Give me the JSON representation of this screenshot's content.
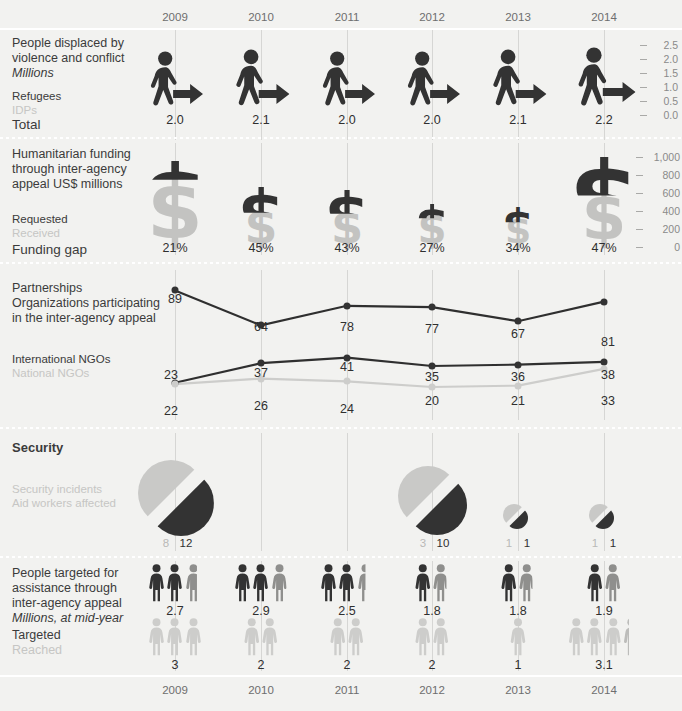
{
  "years": [
    "2009",
    "2010",
    "2011",
    "2012",
    "2013",
    "2014"
  ],
  "colors": {
    "background": "#f2f2f0",
    "dark": "#333333",
    "light": "#c9c9c7",
    "text": "#3b3b3b",
    "muted": "#c6c6c4",
    "gridline": "#d6d6d4"
  },
  "sections": {
    "displaced": {
      "title": "People displaced by\nviolence and conflict",
      "subtitle": "Millions",
      "legend_dark": "Refugees",
      "legend_light": "IDPs",
      "total_label": "Total",
      "axis_ticks": [
        "2.5",
        "2.0",
        "1.5",
        "1.0",
        "0.5",
        "0.0"
      ]
    },
    "funding": {
      "title": "Humanitarian funding\nthrough inter-agency\nappeal ",
      "title_italic": "US$ millions",
      "legend_dark": "Requested",
      "legend_light": "Received",
      "gap_label": "Funding gap",
      "axis_ticks": [
        "1,000",
        "800",
        "600",
        "400",
        "200",
        "0"
      ]
    },
    "partnerships": {
      "title": "Partnerships",
      "subtitle": "Organizations participating\nin the inter-agency appeal",
      "legend_dark": "International NGOs",
      "legend_light": "National NGOs"
    },
    "security": {
      "title": "Security",
      "legend_light": "Security incidents",
      "legend_dark": "Aid workers affected"
    },
    "targeted": {
      "title": "People targeted for\nassistance through\ninter-agency appeal",
      "subtitle": "Millions, at mid-year",
      "legend_dark": "Targeted",
      "legend_light": "Reached"
    }
  },
  "chart_data": [
    {
      "type": "bar",
      "title": "People displaced by violence and conflict",
      "ylabel": "Millions",
      "categories": [
        "2009",
        "2010",
        "2011",
        "2012",
        "2013",
        "2014"
      ],
      "values": [
        2.0,
        2.1,
        2.0,
        2.0,
        2.1,
        2.2
      ],
      "value_labels": [
        "2.0",
        "2.1",
        "2.0",
        "2.0",
        "2.1",
        "2.2"
      ],
      "ylim": [
        0.0,
        2.5
      ],
      "yticks": [
        0.0,
        0.5,
        1.0,
        1.5,
        2.0,
        2.5
      ],
      "legend": [
        "Refugees",
        "IDPs"
      ],
      "grid": true
    },
    {
      "type": "bar",
      "title": "Humanitarian funding through inter-agency appeal",
      "ylabel": "US$ millions",
      "categories": [
        "2009",
        "2010",
        "2011",
        "2012",
        "2013",
        "2014"
      ],
      "series": [
        {
          "name": "Requested",
          "values": [
            900,
            560,
            520,
            330,
            290,
            980
          ]
        },
        {
          "name": "Received",
          "values": [
            711,
            308,
            296,
            241,
            191,
            519
          ]
        }
      ],
      "funding_gap_label": "Funding gap",
      "funding_gap": [
        "21%",
        "45%",
        "43%",
        "27%",
        "34%",
        "47%"
      ],
      "ylim": [
        0,
        1000
      ],
      "yticks": [
        0,
        200,
        400,
        600,
        800,
        1000
      ],
      "legend": [
        "Requested",
        "Received"
      ],
      "grid": true
    },
    {
      "type": "line",
      "title": "Partnerships — Organizations participating in the inter-agency appeal",
      "categories": [
        "2009",
        "2010",
        "2011",
        "2012",
        "2013",
        "2014"
      ],
      "series": [
        {
          "name": "Total organizations",
          "values": [
            89,
            64,
            78,
            77,
            67,
            81
          ]
        },
        {
          "name": "International NGOs",
          "values": [
            23,
            37,
            41,
            35,
            36,
            38
          ]
        },
        {
          "name": "National NGOs",
          "values": [
            22,
            26,
            24,
            20,
            21,
            33
          ]
        }
      ],
      "ylim": [
        0,
        95
      ],
      "legend": [
        "International NGOs",
        "National NGOs"
      ],
      "grid": true
    },
    {
      "type": "pie",
      "title": "Security",
      "categories": [
        "2009",
        "2010",
        "2011",
        "2012",
        "2013",
        "2014"
      ],
      "series": [
        {
          "name": "Security incidents",
          "values": [
            8,
            null,
            null,
            3,
            1,
            1
          ]
        },
        {
          "name": "Aid workers affected",
          "values": [
            12,
            null,
            null,
            10,
            1,
            1
          ]
        }
      ],
      "legend": [
        "Security incidents",
        "Aid workers affected"
      ]
    },
    {
      "type": "bar",
      "title": "People targeted for assistance through inter-agency appeal",
      "ylabel": "Millions, at mid-year",
      "categories": [
        "2009",
        "2010",
        "2011",
        "2012",
        "2013",
        "2014"
      ],
      "series": [
        {
          "name": "Targeted",
          "values": [
            2.7,
            2.9,
            2.5,
            1.8,
            1.8,
            1.9
          ]
        },
        {
          "name": "Reached",
          "values": [
            3,
            2,
            2,
            2,
            1,
            3.1
          ]
        }
      ],
      "targeted_labels": [
        "2.7",
        "2.9",
        "2.5",
        "1.8",
        "1.8",
        "1.9"
      ],
      "reached_labels": [
        "3",
        "2",
        "2",
        "2",
        "1",
        "3.1"
      ],
      "legend": [
        "Targeted",
        "Reached"
      ]
    }
  ],
  "displaced_values": [
    "2.0",
    "2.1",
    "2.0",
    "2.0",
    "2.1",
    "2.2"
  ],
  "funding_gap_values": [
    "21%",
    "45%",
    "43%",
    "27%",
    "34%",
    "47%"
  ],
  "partnerships": {
    "total": [
      "89",
      "64",
      "78",
      "77",
      "67",
      "81"
    ],
    "intl_ngo": [
      "23",
      "37",
      "41",
      "35",
      "36",
      "38"
    ],
    "natl_ngo": [
      "22",
      "26",
      "24",
      "20",
      "21",
      "33"
    ]
  },
  "security_values": [
    {
      "incidents": "8",
      "workers": "12"
    },
    {
      "incidents": "",
      "workers": ""
    },
    {
      "incidents": "",
      "workers": ""
    },
    {
      "incidents": "3",
      "workers": "10"
    },
    {
      "incidents": "1",
      "workers": "1"
    },
    {
      "incidents": "1",
      "workers": "1"
    }
  ],
  "targeted_values": [
    "2.7",
    "2.9",
    "2.5",
    "1.8",
    "1.8",
    "1.9"
  ],
  "reached_values": [
    "3",
    "2",
    "2",
    "2",
    "1",
    "3.1"
  ]
}
